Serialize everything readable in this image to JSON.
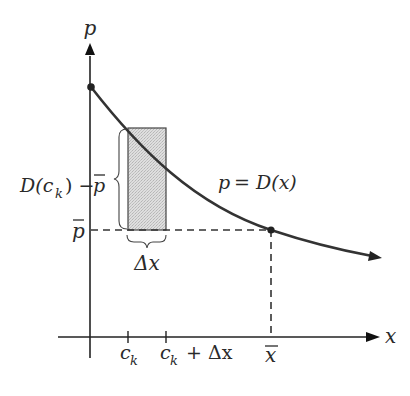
{
  "diagram": {
    "type": "economics-graph",
    "axes": {
      "y_label": "p",
      "x_label": "x"
    },
    "curve": {
      "label": "p = D(x)",
      "label_var": "p",
      "label_eq": "=",
      "label_func": "D(x)"
    },
    "equilibrium": {
      "price_label": "p",
      "quantity_label": "x"
    },
    "rectangle": {
      "height_label_prefix": "D(c",
      "height_label_sub": "k",
      "height_label_suffix": ") −",
      "height_label_pbar": "p",
      "width_label": "Δx"
    },
    "ticks": {
      "ck_main": "c",
      "ck_sub": "k",
      "ck_dx_main": "c",
      "ck_dx_sub": "k",
      "ck_dx_rest": "+ Δx"
    },
    "colors": {
      "line": "#333333",
      "rect_fill": "#d6d6d6",
      "rect_stroke": "#444444"
    }
  }
}
